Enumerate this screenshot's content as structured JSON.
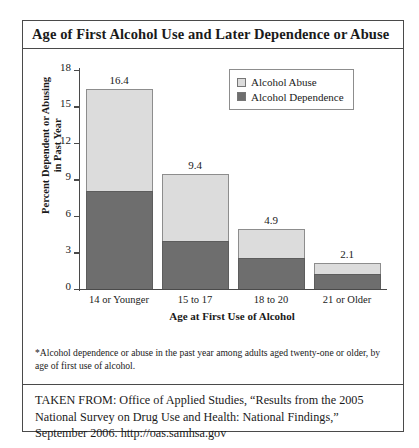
{
  "figure": {
    "title": "Age of First Alcohol Use and Later Dependence or Abuse",
    "footnote": "*Alcohol dependence or abuse in the past year among adults aged twenty-one or older, by age of first use of alcohol.",
    "source_lines": [
      "TAKEN FROM: Office of Applied Studies, “Results from the 2005",
      "National Survey on Drug Use and Health: National Findings,”",
      "September 2006. http://oas.samhsa.gov"
    ]
  },
  "colors": {
    "alcohol_abuse": "#dcdcdc",
    "alcohol_dependence": "#6e6e6e",
    "frame": "#4a4a4a",
    "bar_outline": "#8d8d8d",
    "background": "#ffffff"
  },
  "chart_data": {
    "type": "bar",
    "subtype": "stacked",
    "title": "Age of First Alcohol Use and Later Dependence or Abuse",
    "xlabel": "Age at First Use of Alcohol",
    "ylabel": "Percent Dependent or Abusing in Past Year",
    "ylabel_lines": [
      "Percent Dependent or Abusing",
      "in Past Year"
    ],
    "categories": [
      "14 or Younger",
      "15 to 17",
      "18 to 20",
      "21 or Older"
    ],
    "series": [
      {
        "name": "Alcohol Dependence",
        "color": "#6e6e6e",
        "values": [
          8.0,
          3.9,
          2.5,
          1.2
        ]
      },
      {
        "name": "Alcohol Abuse",
        "color": "#dcdcdc",
        "values": [
          8.4,
          5.5,
          2.4,
          0.9
        ]
      }
    ],
    "totals": [
      16.4,
      9.4,
      4.9,
      2.1
    ],
    "total_labels": [
      "16.4",
      "9.4",
      "4.9",
      "2.1"
    ],
    "ylim": [
      0,
      18
    ],
    "yticks": [
      0,
      3,
      6,
      9,
      12,
      15,
      18
    ],
    "ytick_labels": [
      "0",
      "3",
      "6",
      "9",
      "12",
      "15",
      "18"
    ],
    "grid": false,
    "legend_position": "top-right",
    "legend_entries": [
      "Alcohol Abuse",
      "Alcohol Dependence"
    ]
  }
}
